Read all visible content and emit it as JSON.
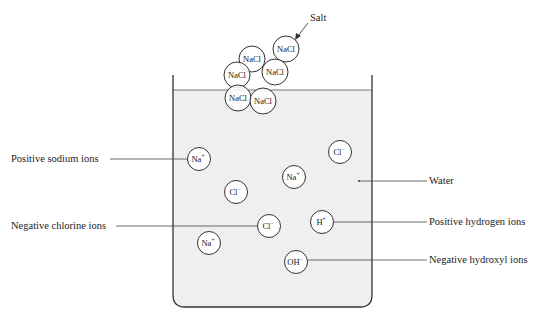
{
  "colors": {
    "water": "#efefef",
    "stroke": "#333333",
    "text": "#222222",
    "background": "#ffffff"
  },
  "salt": {
    "label": "Salt",
    "molecules": [
      {
        "text": "NaCl",
        "cx": 286,
        "cy": 49
      },
      {
        "text": "NaCl",
        "cx": 252,
        "cy": 59
      },
      {
        "text": "NaCl",
        "cx": 275,
        "cy": 72
      },
      {
        "text": "NaCl",
        "cx": 237,
        "cy": 75
      },
      {
        "text": "NaCl",
        "cx": 238,
        "cy": 98
      },
      {
        "text": "NaCl",
        "cx": 263,
        "cy": 101
      }
    ]
  },
  "ions": [
    {
      "base": "Na",
      "charge": "+",
      "cx": 199,
      "cy": 159
    },
    {
      "base": "Cl",
      "charge": "−",
      "cx": 340,
      "cy": 152
    },
    {
      "base": "Na",
      "charge": "+",
      "cx": 294,
      "cy": 177
    },
    {
      "base": "Cl",
      "charge": "−",
      "cx": 236,
      "cy": 192
    },
    {
      "base": "Cl",
      "charge": "−",
      "cx": 269,
      "cy": 226
    },
    {
      "base": "H",
      "charge": "+",
      "cx": 322,
      "cy": 222
    },
    {
      "base": "Na",
      "charge": "+",
      "cx": 209,
      "cy": 243
    },
    {
      "base": "OH",
      "charge": "−",
      "cx": 296,
      "cy": 262
    }
  ],
  "labels": {
    "left": [
      {
        "text": "Positive sodium ions",
        "y": 159
      },
      {
        "text": "Negative chlorine ions",
        "y": 226
      }
    ],
    "right": [
      {
        "text": "Water",
        "y": 181
      },
      {
        "text": "Positive hydrogen ions",
        "y": 222
      },
      {
        "text": "Negative hydroxyl ions",
        "y": 260
      }
    ]
  }
}
